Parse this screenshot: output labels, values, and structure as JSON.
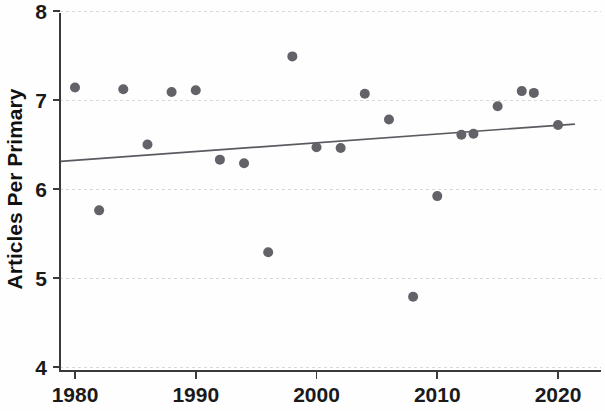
{
  "chart_data": {
    "type": "scatter",
    "title": "",
    "xlabel": "",
    "ylabel": "Articles Per Primary",
    "xlim": [
      1979,
      2021.5
    ],
    "ylim": [
      4,
      8
    ],
    "xticks": [
      1980,
      1990,
      2000,
      2010,
      2020
    ],
    "xtick_labels": [
      "1980",
      "1990",
      "2000",
      "2010",
      "2020"
    ],
    "yticks": [
      4,
      5,
      6,
      7,
      8
    ],
    "ytick_labels": [
      "4",
      "5",
      "6",
      "7",
      "8"
    ],
    "grid": "horizontal-dashed",
    "legend": "none",
    "marker_color": "#626268",
    "line_color": "#5a5a60",
    "axis_color": "#3a3a3a",
    "grid_color": "#d8d8dc",
    "x": [
      1980,
      1982,
      1984,
      1986,
      1988,
      1990,
      1992,
      1994,
      1996,
      1998,
      2000,
      2002,
      2004,
      2006,
      2008,
      2010,
      2012,
      2013,
      2015,
      2017,
      2018,
      2020
    ],
    "y": [
      7.14,
      5.76,
      7.12,
      6.5,
      7.09,
      7.11,
      6.33,
      6.29,
      5.29,
      7.49,
      6.47,
      6.46,
      7.07,
      6.78,
      4.79,
      5.92,
      6.61,
      6.62,
      6.93,
      7.1,
      7.08,
      6.72
    ],
    "points": [
      {
        "x": 1980,
        "y": 7.14
      },
      {
        "x": 1982,
        "y": 5.76
      },
      {
        "x": 1984,
        "y": 7.12
      },
      {
        "x": 1986,
        "y": 6.5
      },
      {
        "x": 1988,
        "y": 7.09
      },
      {
        "x": 1990,
        "y": 7.11
      },
      {
        "x": 1992,
        "y": 6.33
      },
      {
        "x": 1994,
        "y": 6.29
      },
      {
        "x": 1996,
        "y": 5.29
      },
      {
        "x": 1998,
        "y": 7.49
      },
      {
        "x": 2000,
        "y": 6.47
      },
      {
        "x": 2002,
        "y": 6.46
      },
      {
        "x": 2004,
        "y": 7.07
      },
      {
        "x": 2006,
        "y": 6.78
      },
      {
        "x": 2008,
        "y": 4.79
      },
      {
        "x": 2010,
        "y": 5.92
      },
      {
        "x": 2012,
        "y": 6.61
      },
      {
        "x": 2013,
        "y": 6.62
      },
      {
        "x": 2015,
        "y": 6.93
      },
      {
        "x": 2017,
        "y": 7.1
      },
      {
        "x": 2018,
        "y": 7.08
      },
      {
        "x": 2020,
        "y": 6.72
      }
    ],
    "trendline": {
      "type": "linear-fit",
      "x_start": 1978.8,
      "y_start": 6.31,
      "x_end": 2021.4,
      "y_end": 6.73
    },
    "marker_radius_px": 5
  }
}
